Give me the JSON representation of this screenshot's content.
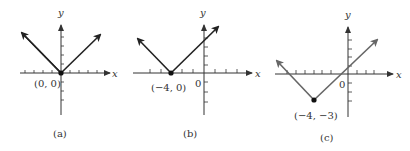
{
  "figure": {
    "panels": [
      {
        "id": "a",
        "caption": "(a)",
        "x_axis_label": "x",
        "y_axis_label": "y",
        "vertex_label": "(0, 0)",
        "origin_label": "",
        "vertex": [
          0,
          0
        ],
        "line_color": "#222222",
        "equation_shape": "y = |x|"
      },
      {
        "id": "b",
        "caption": "(b)",
        "x_axis_label": "x",
        "y_axis_label": "y",
        "vertex_label": "(−4, 0)",
        "origin_label": "0",
        "vertex": [
          -4,
          0
        ],
        "line_color": "#222222",
        "equation_shape": "y = |x + 4|"
      },
      {
        "id": "c",
        "caption": "(c)",
        "x_axis_label": "x",
        "y_axis_label": "y",
        "vertex_label": "(−4, −3)",
        "origin_label": "0",
        "vertex": [
          -4,
          -3
        ],
        "line_color": "#666666",
        "equation_shape": "y = |x + 4| − 3"
      }
    ]
  }
}
